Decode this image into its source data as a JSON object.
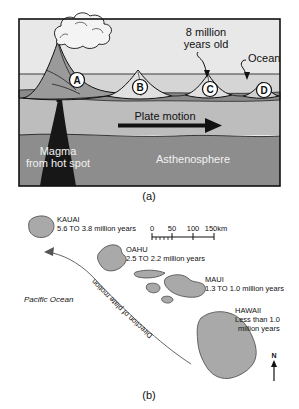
{
  "figure": {
    "panels": [
      {
        "id": "a",
        "caption": "(a)",
        "type": "cross-section-diagram",
        "labels": {
          "age_callout": [
            "8 million",
            "years old"
          ],
          "ocean": "Ocean",
          "plate_motion": "Plate motion",
          "magma": [
            "Magma",
            "from hot spot"
          ],
          "asthenosphere": "Asthenosphere",
          "volcano_markers": [
            "A",
            "B",
            "C",
            "D"
          ]
        },
        "colors": {
          "sky": "#e9e9e9",
          "ocean_water": "#d2d2d2",
          "crust": "#8f8f8f",
          "lithosphere": "#b9b9b9",
          "asthenosphere": "#8a8a8a",
          "magma": "#1a1a1a",
          "outline": "#111111"
        }
      },
      {
        "id": "b",
        "caption": "(b)",
        "type": "map",
        "islands": [
          {
            "name": "KAUAI",
            "age": "5.6 TO 3.8 million years"
          },
          {
            "name": "OAHU",
            "age": "2.5 TO 2.2 million years"
          },
          {
            "name": "MAUI",
            "age": "1.3 TO 1.0 million years"
          },
          {
            "name": "HAWAII",
            "age_line1": "Less than 1.0",
            "age_line2": "million years"
          }
        ],
        "ocean_label": "Pacific Ocean",
        "arrow_label": "Direction of plate motion",
        "compass": "N",
        "scalebar": {
          "ticks": [
            "0",
            "50",
            "100",
            "150km"
          ]
        },
        "colors": {
          "island_fill": "#a9a9a9",
          "island_outline": "#555555",
          "text": "#111111"
        }
      }
    ]
  }
}
